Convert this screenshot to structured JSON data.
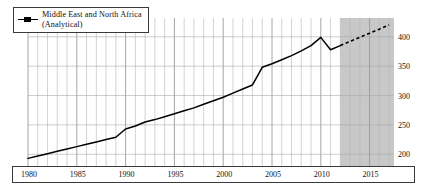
{
  "chart_data": {
    "type": "line",
    "title": "",
    "subtitle": "",
    "xlabel": "",
    "ylabel": "",
    "xlim": [
      1980,
      2017.5
    ],
    "ylim": [
      180,
      432
    ],
    "grid": true,
    "grid_minor_x": "yearly",
    "legend_position": "top-left",
    "legend": [
      {
        "label_line1": "Middle East and North Africa",
        "label_line2": "(Analytical)",
        "marker": "line-with-square",
        "color": "#000000"
      }
    ],
    "xticks": [
      1980,
      1985,
      1990,
      1995,
      2000,
      2005,
      2010,
      2015
    ],
    "xtick_labels": [
      "1980",
      "1985",
      "1990",
      "1995",
      "2000",
      "2005",
      "2010",
      "2015"
    ],
    "yticks": [
      200,
      250,
      300,
      350,
      400
    ],
    "ytick_labels": [
      "200",
      "250",
      "300",
      "350",
      "400"
    ],
    "ytick_side": "right",
    "shaded_region": {
      "label": "forecast",
      "x_start": 2012,
      "x_end": 2017.5,
      "color": "#c8c8c8"
    },
    "series": [
      {
        "name": "Middle East and North Africa (Analytical)",
        "style": "solid",
        "color": "#000000",
        "x": [
          1980,
          1981,
          1982,
          1983,
          1984,
          1985,
          1986,
          1987,
          1988,
          1989,
          1990,
          1991,
          1992,
          1993,
          1994,
          1995,
          1996,
          1997,
          1998,
          1999,
          2000,
          2001,
          2002,
          2003,
          2004,
          2005,
          2006,
          2007,
          2008,
          2009,
          2010,
          2011,
          2012
        ],
        "values": [
          193,
          197,
          201,
          205,
          209,
          213,
          217,
          221,
          225,
          229,
          243,
          248,
          255,
          259,
          264,
          269,
          274,
          279,
          285,
          291,
          297,
          304,
          311,
          318,
          348,
          354,
          361,
          368,
          376,
          385,
          399,
          378,
          385
        ]
      },
      {
        "name": "Middle East and North Africa (Analytical) — projection",
        "style": "dashed",
        "color": "#000000",
        "x": [
          2012,
          2013,
          2014,
          2015,
          2016,
          2017
        ],
        "values": [
          385,
          392,
          399,
          406,
          413,
          420
        ]
      }
    ]
  }
}
